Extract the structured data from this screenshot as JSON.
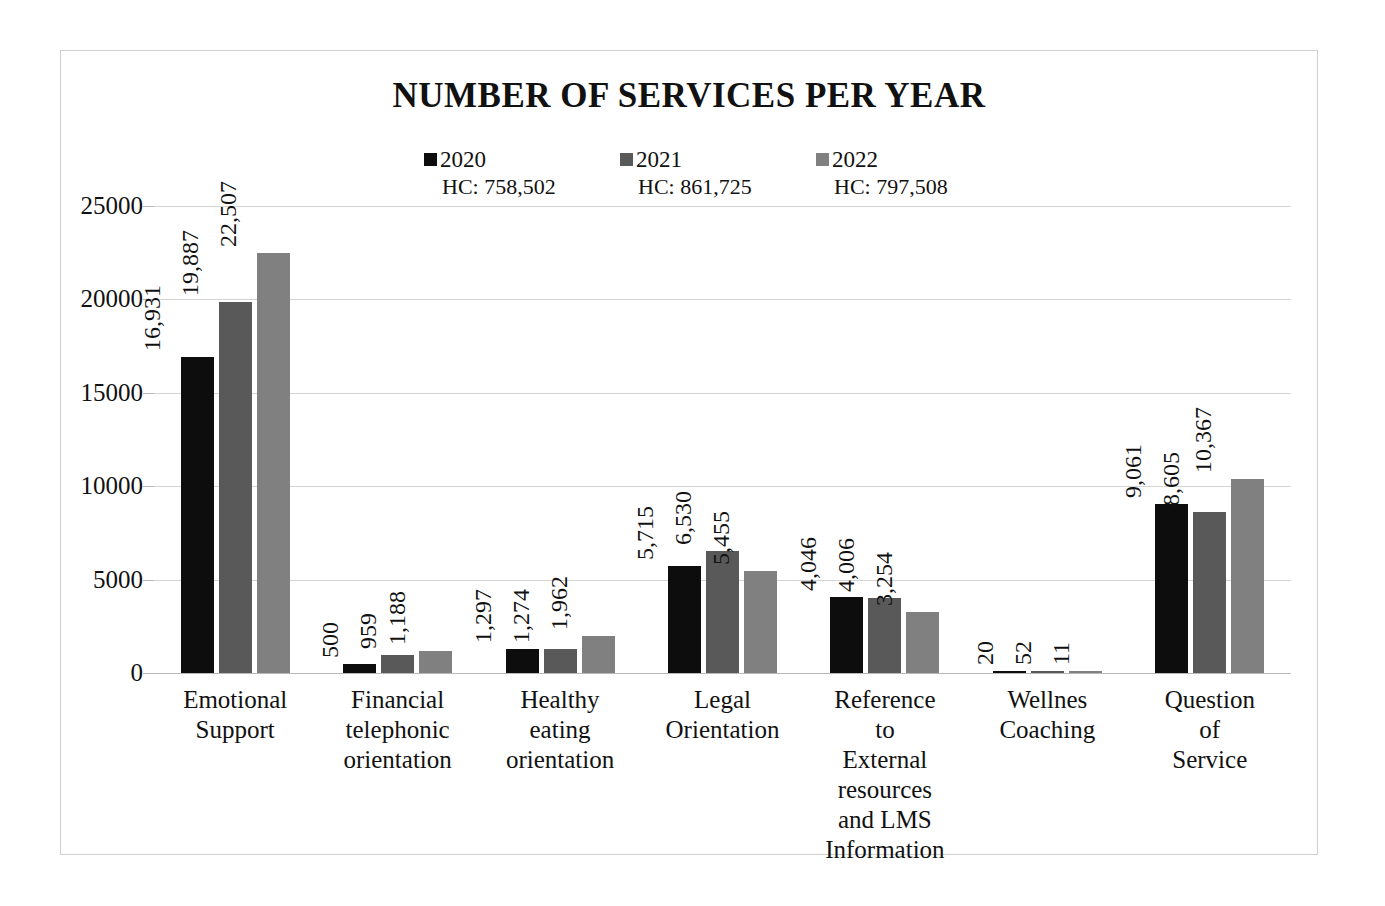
{
  "chart_data": {
    "type": "bar",
    "title": "NUMBER OF SERVICES PER YEAR",
    "xlabel": "",
    "ylabel": "",
    "ylim": [
      0,
      25000
    ],
    "ytick_labels": [
      "25000",
      "20000",
      "15000",
      "10000",
      "5000",
      "0"
    ],
    "ytick_values": [
      25000,
      20000,
      15000,
      10000,
      5000,
      0
    ],
    "grid": true,
    "legend_position": "top",
    "categories": [
      "Emotional Support",
      "Financial telephonic orientation",
      "Healthy eating orientation",
      "Legal Orientation",
      "Reference to External resources and LMS Information",
      "Wellnes Coaching",
      "Question of Service"
    ],
    "category_lines": [
      [
        "Emotional",
        "Support"
      ],
      [
        "Financial",
        "telephonic",
        "orientation"
      ],
      [
        "Healthy eating",
        "orientation"
      ],
      [
        "Legal",
        "Orientation"
      ],
      [
        "Reference to",
        "External",
        "resources",
        "and LMS",
        "Information"
      ],
      [
        "Wellnes",
        "Coaching"
      ],
      [
        "Question of",
        "Service"
      ]
    ],
    "series": [
      {
        "name": "2020",
        "color": "#0d0d0d",
        "hc_label": "HC: 758,502",
        "hc_value": 758502,
        "values": [
          16931,
          500,
          1297,
          5715,
          4046,
          20,
          9061
        ],
        "value_labels": [
          "16,931",
          "500",
          "1,297",
          "5,715",
          "4,046",
          "20",
          "9,061"
        ]
      },
      {
        "name": "2021",
        "color": "#595959",
        "hc_label": "HC: 861,725",
        "hc_value": 861725,
        "values": [
          19887,
          959,
          1274,
          6530,
          4006,
          52,
          8605
        ],
        "value_labels": [
          "19,887",
          "959",
          "1,274",
          "6,530",
          "4,006",
          "52",
          "8,605"
        ]
      },
      {
        "name": "2022",
        "color": "#808080",
        "hc_label": "HC: 797,508",
        "hc_value": 797508,
        "values": [
          22507,
          1188,
          1962,
          5455,
          3254,
          11,
          10367
        ],
        "value_labels": [
          "22,507",
          "1,188",
          "1,962",
          "5,455",
          "3,254",
          "11",
          "10,367"
        ]
      }
    ]
  },
  "style": {
    "frame_border": "#cfcfcf",
    "gridline": "#d4d4d4",
    "axis_line": "#b8b8b8",
    "text": "#111111",
    "background": "#ffffff"
  }
}
